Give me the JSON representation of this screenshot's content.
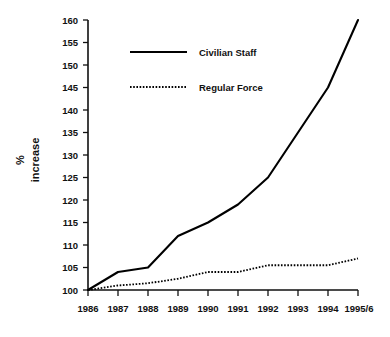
{
  "chart_data": {
    "type": "line",
    "title": "",
    "subtitle": "",
    "xlabel": "",
    "ylabel": "% increase",
    "ylabel_lines": [
      "%",
      "increase"
    ],
    "categories": [
      "1986",
      "1987",
      "1988",
      "1989",
      "1990",
      "1991",
      "1992",
      "1993",
      "1994",
      "1995/6"
    ],
    "x": [
      "1986",
      "1987",
      "1988",
      "1989",
      "1990",
      "1991",
      "1992",
      "1993",
      "1994",
      "1995/6"
    ],
    "series": [
      {
        "name": "Civilian Staff",
        "style": "solid",
        "color": "#000000",
        "values": [
          100,
          104,
          105,
          112,
          115,
          119,
          125,
          135,
          145,
          160
        ]
      },
      {
        "name": "Regular Force",
        "style": "dotted",
        "color": "#000000",
        "values": [
          100,
          101,
          101.5,
          102.5,
          104,
          104,
          105.5,
          105.5,
          105.5,
          107
        ]
      }
    ],
    "ylim": [
      100,
      160
    ],
    "ytick_step": 5,
    "yticks": [
      100,
      105,
      110,
      115,
      120,
      125,
      130,
      135,
      140,
      145,
      150,
      155,
      160
    ],
    "ytick_labels": [
      "100",
      "105",
      "110",
      "115",
      "120",
      "125",
      "130",
      "135",
      "140",
      "145",
      "150",
      "155",
      "160"
    ],
    "xtick_labels": [
      "1986",
      "1987",
      "1988",
      "1989",
      "1990",
      "1991",
      "1992",
      "1993",
      "1994",
      "1995/6"
    ],
    "grid": false,
    "legend_position": "upper-left-inside",
    "legend_entries": [
      "Civilian Staff",
      "Regular Force"
    ],
    "annotations": [],
    "background_color": "#ffffff",
    "axis_color": "#111111"
  },
  "legend": {
    "items": [
      {
        "label": "Civilian Staff",
        "style": "solid"
      },
      {
        "label": "Regular Force",
        "style": "dotted"
      }
    ]
  },
  "axes": {
    "y_title_line1": "%",
    "y_title_line2": "increase"
  }
}
